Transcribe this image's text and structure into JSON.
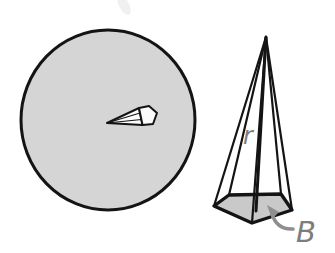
{
  "figure": {
    "labels": {
      "radius": "r",
      "base": "B"
    },
    "colors": {
      "background": "#ffffff",
      "circle_fill": "#d5d5d5",
      "pyramid_base_fill": "#c9c9c9",
      "cutout_fill": "#fcfcfc",
      "outline": "#141414",
      "label": "#7d7d7d",
      "arrow": "#8f8f8f"
    }
  }
}
